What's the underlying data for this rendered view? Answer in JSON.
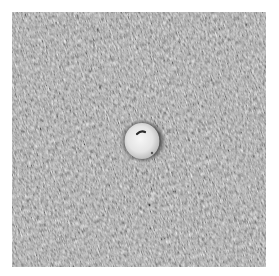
{
  "image": {
    "description": "Grayscale micrograph of a finely textured fabric-like surface with a single round white bead sitting in a dark-rimmed pit at the center",
    "subject": "round white particle in a crater",
    "palette": {
      "background": "#ffffff",
      "texture_mid": "#7a7a7a",
      "texture_dark": "#4a4a4a",
      "texture_light": "#b8b8b8",
      "particle": "#ececec",
      "rim_shadow": "#2e2e2e"
    }
  }
}
